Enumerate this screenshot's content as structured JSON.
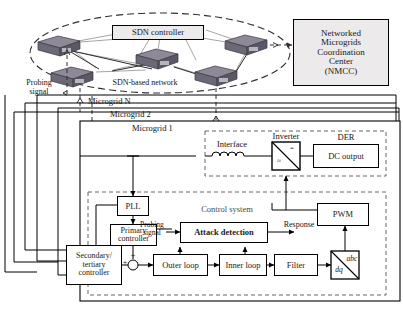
{
  "figure": {
    "kind": "block-diagram"
  },
  "network": {
    "controller_label": "SDN controller",
    "network_label": "SDN-based network",
    "probing_label": "Probing\nsignal",
    "switch_name": "sdn-switch",
    "switch_count": 5
  },
  "nmcc": {
    "line1": "Networked",
    "line2": "Microgrids",
    "line3": "Coordination",
    "line4": "Center",
    "line5": "(NMCC)"
  },
  "frames": {
    "microgrid_n": "Microgrid N",
    "microgrid_2": "Microgrid 2",
    "microgrid_1": "Microgrid 1"
  },
  "power_stage": {
    "interface": "Interface",
    "inverter": "Inverter",
    "inverter_dc": "=",
    "inverter_ac": "≈",
    "der": "DER",
    "dc_output": "DC output"
  },
  "control": {
    "title": "Control system",
    "pll": "PLL",
    "primary": "Primary\ncontroller",
    "secondary": "Secondary/\ntertiary\ncontroller",
    "attack_detection": "Attack detection",
    "probing_signal": "Probing\nsignal",
    "response": "Response",
    "pwm": "PWM",
    "outer_loop": "Outer loop",
    "inner_loop": "Inner loop",
    "filter": "Filter",
    "transform_abc": "abc",
    "transform_dq": "dq",
    "sum_plus_top": "+",
    "sum_plus_left": "+"
  },
  "colors": {
    "line": "#000000",
    "box_fill": "#ffffff",
    "panel_fill": "#eceaea",
    "switch_top": "#8f8b99",
    "switch_face": "#6f6a7a",
    "switch_side": "#5d5866",
    "dashed": "#3a3a3a",
    "link": "#7a7a7a"
  }
}
